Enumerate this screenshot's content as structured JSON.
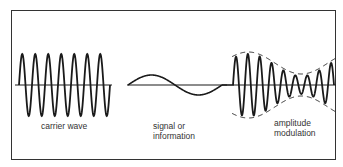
{
  "diagram": {
    "panels": [
      {
        "id": "carrier",
        "label": "carrier wave"
      },
      {
        "id": "signal",
        "label_line1": "signal or",
        "label_line2": "information"
      },
      {
        "id": "am",
        "label_line1": "amplitude",
        "label_line2": "modulation"
      }
    ],
    "colors": {
      "stroke": "#1a1a1a",
      "frame": "#333333",
      "background": "#ffffff"
    }
  }
}
